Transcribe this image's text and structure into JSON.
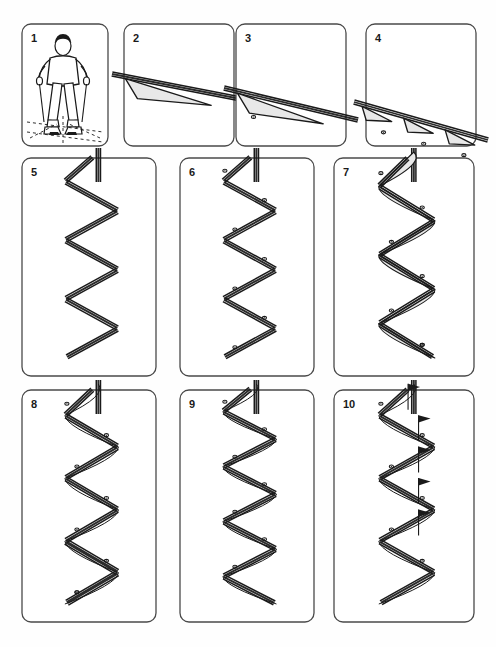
{
  "sheet": {
    "title": "Ski Technique Progression Chart",
    "background_color": "#fefefe",
    "ink_color": "#1a1a1a",
    "fill_color": "#e8e8e8",
    "width": 496,
    "height": 647
  },
  "rows": [
    {
      "row_index": 0,
      "panels": [
        {
          "number": "1",
          "x": 22,
          "y": 24,
          "w": 86,
          "h": 122,
          "content_type": "skier-figure",
          "description": "front view of skier standing on skis with poles, dashed slope reference lines at feet"
        },
        {
          "number": "2",
          "x": 124,
          "y": 24,
          "w": 110,
          "h": 122,
          "content_type": "traverse-track",
          "wedge_count": 1,
          "pole_dot_count": 0,
          "description": "long shallow descending track with one shaded wedge turn"
        },
        {
          "number": "3",
          "x": 236,
          "y": 24,
          "w": 110,
          "h": 122,
          "content_type": "traverse-track",
          "wedge_count": 1,
          "pole_dot_count": 1,
          "description": "continuation of descending track with wedge turn and pole plant dot"
        },
        {
          "number": "4",
          "x": 366,
          "y": 24,
          "w": 110,
          "h": 122,
          "content_type": "traverse-track",
          "wedge_count": 3,
          "pole_dot_count": 3,
          "description": "shorter radius wedge turns with pole plant dots"
        }
      ]
    },
    {
      "row_index": 1,
      "panels": [
        {
          "number": "5",
          "x": 22,
          "y": 158,
          "w": 134,
          "h": 218,
          "content_type": "zigzag-track",
          "segment_count": 7,
          "pole_dot_count": 0,
          "has_arcs": false,
          "description": "straight fall-line zigzag of linked traverse segments, no pole plants"
        },
        {
          "number": "6",
          "x": 180,
          "y": 158,
          "w": 134,
          "h": 218,
          "content_type": "zigzag-track",
          "segment_count": 7,
          "pole_dot_count": 7,
          "has_arcs": false,
          "description": "same zigzag with pole plant dots added at each turn"
        },
        {
          "number": "7",
          "x": 334,
          "y": 158,
          "w": 140,
          "h": 218,
          "content_type": "zigzag-track-arcs",
          "segment_count": 6,
          "pole_dot_count": 7,
          "has_arcs": true,
          "description": "zigzag with shaded curved wedge arcs joining each turn"
        }
      ]
    },
    {
      "row_index": 2,
      "panels": [
        {
          "number": "8",
          "x": 22,
          "y": 390,
          "w": 134,
          "h": 232,
          "content_type": "carved-track",
          "segment_count": 7,
          "pole_dot_count": 8,
          "has_arcs": true,
          "description": "narrower zigzag with thin connecting arcs and heavy parallel tracks at base"
        },
        {
          "number": "9",
          "x": 180,
          "y": 390,
          "w": 134,
          "h": 232,
          "content_type": "carved-track",
          "segment_count": 8,
          "pole_dot_count": 7,
          "has_arcs": true,
          "description": "tighter rhythmic short turns with S-shaped connecting arcs"
        },
        {
          "number": "10",
          "x": 334,
          "y": 390,
          "w": 140,
          "h": 232,
          "content_type": "slalom-course",
          "segment_count": 7,
          "pole_dot_count": 6,
          "gate_flag_count": 5,
          "has_arcs": true,
          "description": "slalom course with triangular gate flags and rhythmic carved turns"
        }
      ]
    }
  ]
}
